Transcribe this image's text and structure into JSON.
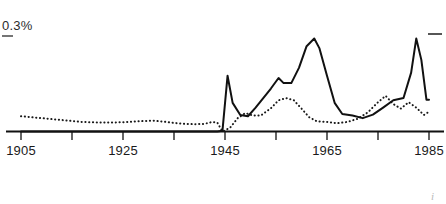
{
  "chart_data": {
    "type": "line",
    "title": "",
    "xlabel": "",
    "ylabel": "0.3%",
    "y_axis_label_text": "0.3%",
    "xlim": [
      1905,
      1985
    ],
    "ylim": [
      0,
      0.3
    ],
    "grid": false,
    "legend_position": "none",
    "x_tick_labels": [
      "1905",
      "1925",
      "1945",
      "1965",
      "1985"
    ],
    "x_ticks_labeled": [
      1905,
      1925,
      1945,
      1965,
      1985
    ],
    "x_ticks_unlabeled": [
      1915,
      1935,
      1955,
      1975
    ],
    "y_ticks": [
      0.3
    ],
    "corner_mark": "i",
    "series": [
      {
        "name": "solid-line",
        "style": "solid",
        "color": "#111111",
        "x": [
          1905,
          1910,
          1915,
          1920,
          1925,
          1930,
          1935,
          1940,
          1942,
          1943.5,
          1944.5,
          1945.5,
          1946.5,
          1948,
          1949.5,
          1951,
          1952.5,
          1954,
          1955.5,
          1956.5,
          1958,
          1959.5,
          1961,
          1962.5,
          1963.5,
          1965,
          1966.5,
          1968,
          1970,
          1972,
          1974,
          1976,
          1978,
          1980,
          1981.5,
          1982.5,
          1983.5,
          1984.5,
          1985
        ],
        "y": [
          0.0,
          0.0,
          0.0,
          0.0,
          0.0,
          0.0,
          0.0,
          0.0,
          0.0,
          0.0,
          0.002,
          0.175,
          0.09,
          0.052,
          0.048,
          0.075,
          0.105,
          0.135,
          0.168,
          0.152,
          0.152,
          0.2,
          0.268,
          0.292,
          0.262,
          0.175,
          0.09,
          0.055,
          0.05,
          0.042,
          0.053,
          0.075,
          0.098,
          0.105,
          0.185,
          0.292,
          0.225,
          0.1,
          0.1
        ]
      },
      {
        "name": "dotted-line",
        "style": "dotted",
        "color": "#1a1a1a",
        "x": [
          1905,
          1909,
          1913,
          1917,
          1921,
          1925,
          1929,
          1931,
          1933,
          1935,
          1937,
          1939,
          1941,
          1942.5,
          1943.5,
          1944.5,
          1946,
          1947.5,
          1949,
          1950.5,
          1952,
          1954,
          1955.5,
          1957,
          1958.5,
          1960,
          1961.5,
          1963,
          1965,
          1967,
          1969,
          1971,
          1973,
          1975,
          1976.5,
          1978,
          1979.5,
          1981,
          1982.5,
          1984,
          1985
        ],
        "y": [
          0.048,
          0.042,
          0.036,
          0.03,
          0.028,
          0.029,
          0.033,
          0.034,
          0.031,
          0.027,
          0.024,
          0.023,
          0.024,
          0.03,
          0.028,
          0.0,
          0.012,
          0.042,
          0.058,
          0.05,
          0.05,
          0.073,
          0.098,
          0.105,
          0.098,
          0.072,
          0.045,
          0.032,
          0.03,
          0.026,
          0.03,
          0.04,
          0.06,
          0.092,
          0.112,
          0.086,
          0.072,
          0.092,
          0.075,
          0.052,
          0.062
        ]
      }
    ]
  },
  "axis": {
    "baseline_color": "#111111",
    "tick_color": "#111111"
  }
}
